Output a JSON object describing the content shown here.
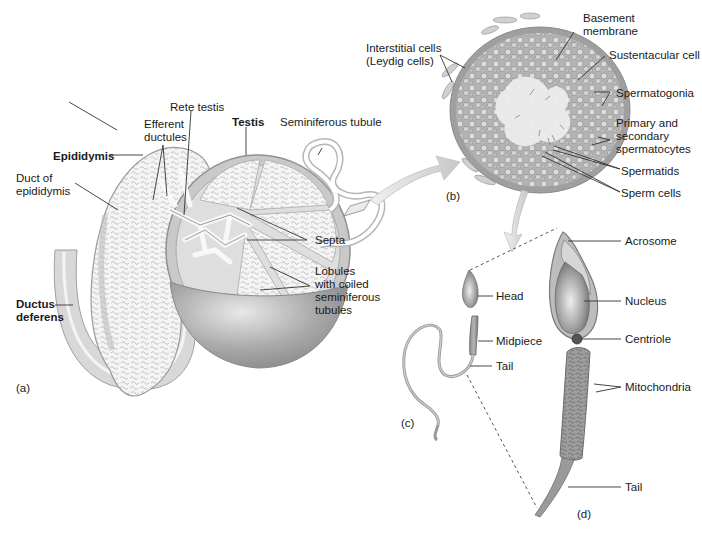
{
  "figure": {
    "panels": {
      "a": "(a)",
      "b": "(b)",
      "c": "(c)",
      "d": "(d)"
    },
    "panel_a_labels": {
      "rete_testis": "Rete testis",
      "efferent_ductules_1": "Efferent",
      "efferent_ductules_2": "ductules",
      "testis": "Testis",
      "seminiferous_tubule": "Seminiferous tubule",
      "epididymis": "Epididymis",
      "duct_of_epididymis_1": "Duct of",
      "duct_of_epididymis_2": "epididymis",
      "septa": "Septa",
      "lobules_1": "Lobules",
      "lobules_2": "with coiled",
      "lobules_3": "seminiferous",
      "lobules_4": "tubules",
      "ductus_deferens_1": "Ductus",
      "ductus_deferens_2": "deferens"
    },
    "panel_b_labels": {
      "interstitial_1": "Interstitial cells",
      "interstitial_2": "(Leydig cells)",
      "basement_1": "Basement",
      "basement_2": "membrane",
      "sustentacular": "Sustentacular cell",
      "spermatogonia": "Spermatogonia",
      "spermatocytes_1": "Primary and",
      "spermatocytes_2": "secondary",
      "spermatocytes_3": "spermatocytes",
      "spermatids": "Spermatids",
      "sperm_cells": "Sperm cells"
    },
    "panel_c_labels": {
      "head": "Head",
      "midpiece": "Midpiece",
      "tail": "Tail"
    },
    "panel_d_labels": {
      "acrosome": "Acrosome",
      "nucleus": "Nucleus",
      "centriole": "Centriole",
      "mitochondria": "Mitochondria",
      "tail": "Tail"
    }
  }
}
